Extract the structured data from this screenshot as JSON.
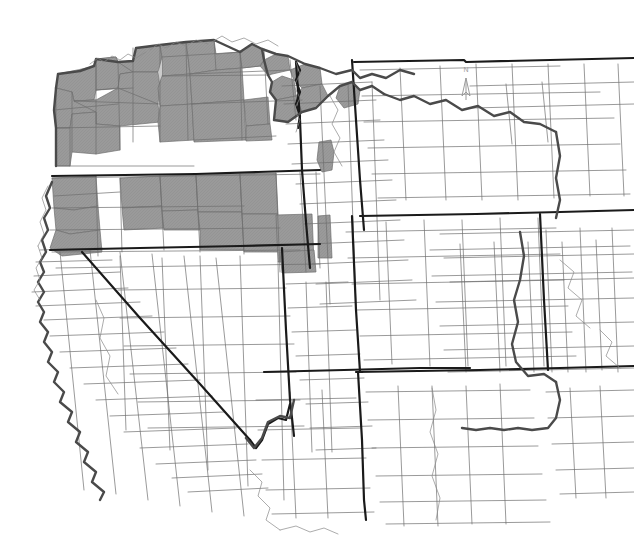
{
  "map": {
    "title": "Western United States County Map",
    "description": "Grayscale choropleth map of western U.S. counties; selected counties in the Pacific Northwest, northern California, Idaho, northern Nevada and western Wyoming are shaded gray.",
    "background_color": "#ffffff",
    "county_fill_default": "#ffffff",
    "county_fill_highlight": "#9a9a9a",
    "county_line_color": "#6e6e6e",
    "state_line_color": "#1a1a1a",
    "coastline_color": "#555555",
    "county_line_width": 0.7,
    "state_line_width": 2.2,
    "width": 634,
    "height": 550,
    "north_arrow": {
      "label": "N",
      "x": 466,
      "y": 78,
      "color": "#9b9b9b"
    },
    "states": [
      {
        "code": "WA",
        "name": "Washington"
      },
      {
        "code": "OR",
        "name": "Oregon"
      },
      {
        "code": "CA",
        "name": "California"
      },
      {
        "code": "NV",
        "name": "Nevada"
      },
      {
        "code": "ID",
        "name": "Idaho"
      },
      {
        "code": "MT",
        "name": "Montana"
      },
      {
        "code": "WY",
        "name": "Wyoming"
      },
      {
        "code": "UT",
        "name": "Utah"
      },
      {
        "code": "CO",
        "name": "Colorado"
      },
      {
        "code": "AZ",
        "name": "Arizona"
      },
      {
        "code": "NM",
        "name": "New Mexico"
      },
      {
        "code": "NE",
        "name": "Nebraska"
      },
      {
        "code": "KS",
        "name": "Kansas"
      },
      {
        "code": "OK",
        "name": "Oklahoma"
      },
      {
        "code": "TX",
        "name": "Texas"
      },
      {
        "code": "SD",
        "name": "South Dakota"
      },
      {
        "code": "ND",
        "name": "North Dakota"
      }
    ],
    "highlight_summary": {
      "shaded_regions": [
        "Washington — nearly all counties shaded",
        "Oregon — northern and western counties shaded",
        "Northern California — northeast corner counties shaded",
        "Idaho — panhandle and a single isolated central county shaded",
        "Northern Nevada — northern tier counties shaded",
        "Western Wyoming — one southwestern county shaded"
      ],
      "shaded_count": 62,
      "unshaded_count": 330
    }
  }
}
